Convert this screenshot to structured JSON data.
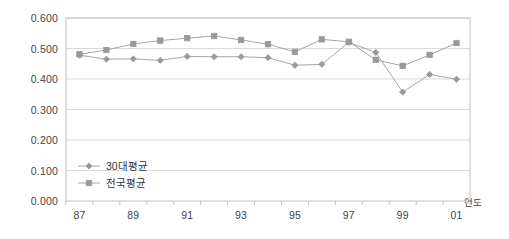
{
  "chart_data": {
    "type": "line",
    "title": "",
    "xlabel": "연도",
    "ylabel": "",
    "categories": [
      "87",
      "88",
      "89",
      "90",
      "91",
      "92",
      "93",
      "94",
      "95",
      "96",
      "97",
      "98",
      "99",
      "00",
      "01"
    ],
    "xtick_labels": [
      "87",
      "",
      "89",
      "",
      "91",
      "",
      "93",
      "",
      "95",
      "",
      "97",
      "",
      "99",
      "",
      "01"
    ],
    "ytick_labels": [
      "0.000",
      "0.100",
      "0.200",
      "0.300",
      "0.400",
      "0.500",
      "0.600"
    ],
    "ylim": [
      0.0,
      0.6
    ],
    "ytick_step": 0.1,
    "grid": true,
    "legend_position": "inside-bottom-left",
    "series": [
      {
        "name": "30대평균",
        "marker": "diamond",
        "color": "#999999",
        "values": [
          0.478,
          0.465,
          0.466,
          0.461,
          0.474,
          0.473,
          0.473,
          0.47,
          0.445,
          0.448,
          0.52,
          0.487,
          0.357,
          0.415,
          0.399
        ]
      },
      {
        "name": "전국평균",
        "marker": "square",
        "color": "#999999",
        "values": [
          0.481,
          0.495,
          0.515,
          0.526,
          0.534,
          0.541,
          0.528,
          0.514,
          0.489,
          0.53,
          0.522,
          0.463,
          0.443,
          0.479,
          0.518
        ]
      }
    ]
  },
  "legend": {
    "entries": [
      {
        "label": "30대평균"
      },
      {
        "label": "전국평균"
      }
    ]
  },
  "axes": {
    "x_title": "연도"
  },
  "style": {
    "line_color": "#a6a6a6",
    "marker_color": "#999999",
    "grid_color": "#d9d9d9",
    "frame_color": "#c0c0c0",
    "text_color": "#444444"
  }
}
